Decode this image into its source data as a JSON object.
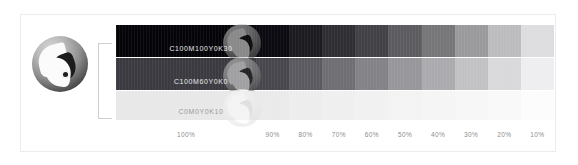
{
  "figure": {
    "type": "color-tint-chart",
    "background": "#ffffff",
    "frame_border_color": "#ececec"
  },
  "logo": {
    "name": "yc-brand-mark",
    "shape": "circle",
    "colors": [
      "#d8d8d8",
      "#8e8e8e",
      "#272727"
    ]
  },
  "bracket": {
    "color": "#cfcfcf"
  },
  "strips": [
    {
      "id": "strip-1",
      "label": "C100M100Y0K30",
      "label_style": "light",
      "watermark": "dark",
      "swatches": [
        {
          "tint": "100%",
          "color": "#050509"
        },
        {
          "tint": "90%",
          "color": "#0a0a10"
        },
        {
          "tint": "80%",
          "color": "#1b1b20"
        },
        {
          "tint": "70%",
          "color": "#2e2e33"
        },
        {
          "tint": "60%",
          "color": "#414146"
        },
        {
          "tint": "50%",
          "color": "#5c5c60"
        },
        {
          "tint": "40%",
          "color": "#767679"
        },
        {
          "tint": "30%",
          "color": "#9a9a9d"
        },
        {
          "tint": "20%",
          "color": "#bcbcbe"
        },
        {
          "tint": "10%",
          "color": "#dddddf"
        }
      ]
    },
    {
      "id": "strip-2",
      "label": "C100M60Y0K0",
      "label_style": "light",
      "watermark": "dark",
      "swatches": [
        {
          "tint": "100%",
          "color": "#3a3a40"
        },
        {
          "tint": "90%",
          "color": "#47474d"
        },
        {
          "tint": "80%",
          "color": "#5a5a60"
        },
        {
          "tint": "70%",
          "color": "#6e6e73"
        },
        {
          "tint": "60%",
          "color": "#828287"
        },
        {
          "tint": "50%",
          "color": "#97979b"
        },
        {
          "tint": "40%",
          "color": "#ababaf"
        },
        {
          "tint": "30%",
          "color": "#c2c2c5"
        },
        {
          "tint": "20%",
          "color": "#d9d9db"
        },
        {
          "tint": "10%",
          "color": "#eeeef0"
        }
      ]
    },
    {
      "id": "strip-3",
      "label": "C0M0Y0K10",
      "label_style": "dark",
      "watermark": "light",
      "swatches": [
        {
          "tint": "100%",
          "color": "#e8e8e8"
        },
        {
          "tint": "90%",
          "color": "#eaeaea"
        },
        {
          "tint": "80%",
          "color": "#ededed"
        },
        {
          "tint": "70%",
          "color": "#efefef"
        },
        {
          "tint": "60%",
          "color": "#f1f1f1"
        },
        {
          "tint": "50%",
          "color": "#f3f3f3"
        },
        {
          "tint": "40%",
          "color": "#f5f5f5"
        },
        {
          "tint": "30%",
          "color": "#f7f7f7"
        },
        {
          "tint": "20%",
          "color": "#f9f9f9"
        },
        {
          "tint": "10%",
          "color": "#fcfcfc"
        }
      ]
    }
  ],
  "axis": {
    "ticks": [
      "100%",
      "90%",
      "80%",
      "70%",
      "60%",
      "50%",
      "40%",
      "30%",
      "20%",
      "10%"
    ],
    "color": "#8d8d8d"
  }
}
